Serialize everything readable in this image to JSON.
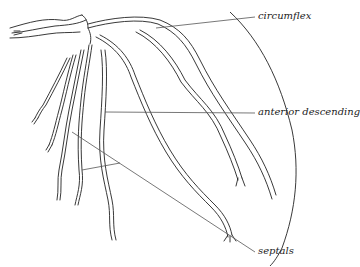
{
  "diagram": {
    "labels": [
      {
        "id": "circumflex",
        "text": "circumflex"
      },
      {
        "id": "anterior_descending",
        "text": "anterior descending"
      },
      {
        "id": "septals",
        "text": "septals"
      }
    ],
    "colors": {
      "line": "#222222",
      "leader": "#555555",
      "background": "#ffffff"
    }
  }
}
